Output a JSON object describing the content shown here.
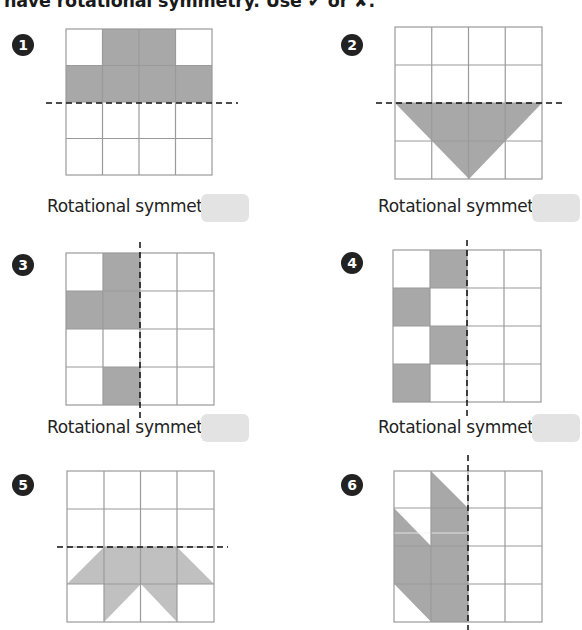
{
  "instruction": "have rotational symmetry. Use ✔ or ✘.",
  "colors": {
    "shade": "#a8a8a8",
    "grid": "#9a9a9a",
    "answer_box": "#e3e3e3"
  },
  "answer_label": "Rotational symmetry:",
  "problems": [
    {
      "number": "1",
      "line": "horizontal",
      "answer": ""
    },
    {
      "number": "2",
      "line": "horizontal",
      "answer": ""
    },
    {
      "number": "3",
      "line": "vertical",
      "answer": ""
    },
    {
      "number": "4",
      "line": "vertical",
      "answer": ""
    },
    {
      "number": "5",
      "line": "horizontal",
      "answer": ""
    },
    {
      "number": "6",
      "line": "vertical",
      "answer": ""
    }
  ]
}
